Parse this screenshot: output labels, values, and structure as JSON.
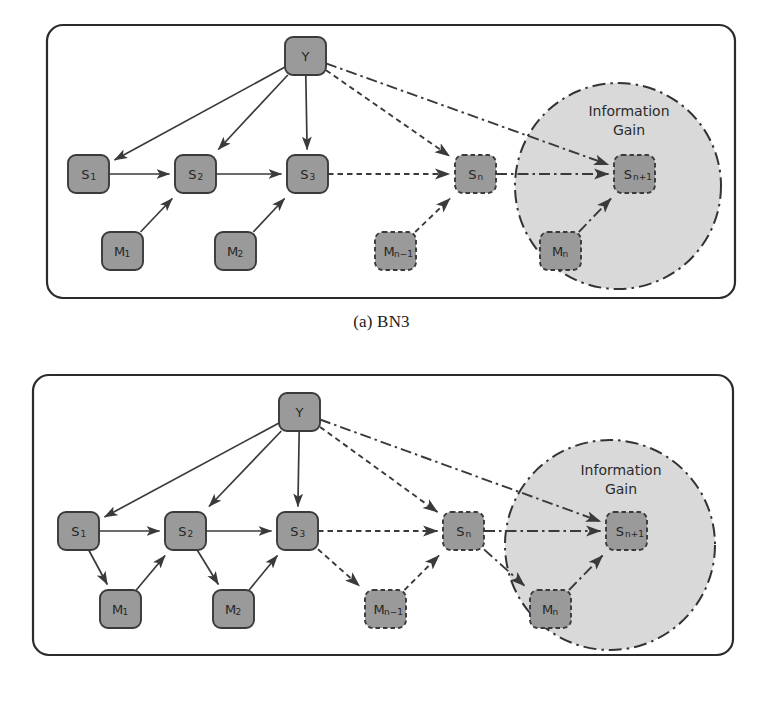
{
  "figure": {
    "style": {
      "node_fill": "#9a9a9a",
      "node_stroke": "#3a3a3a",
      "panel_stroke": "#2b2b2b",
      "circle_fill": "#d9d9d9",
      "circle_stroke": "#333333",
      "edge_color": "#3a3a3a",
      "background": "#ffffff"
    },
    "subfigures": [
      {
        "id": "BN3",
        "caption": "(a) BN3",
        "region_label": "Information Gain",
        "region_label_lines": [
          "Information",
          "Gain"
        ],
        "nodes": [
          {
            "id": "Y",
            "label": "Y",
            "sub": "",
            "style": "solid",
            "x": 285,
            "y": 37
          },
          {
            "id": "S1",
            "label": "S",
            "sub": "1",
            "style": "solid",
            "x": 68,
            "y": 155
          },
          {
            "id": "S2",
            "label": "S",
            "sub": "2",
            "style": "solid",
            "x": 175,
            "y": 155
          },
          {
            "id": "S3",
            "label": "S",
            "sub": "3",
            "style": "solid",
            "x": 287,
            "y": 155
          },
          {
            "id": "Sn",
            "label": "S",
            "sub": "n",
            "style": "dashed",
            "x": 455,
            "y": 155
          },
          {
            "id": "Sn1",
            "label": "S",
            "sub": "n+1",
            "style": "dashed",
            "x": 614,
            "y": 155
          },
          {
            "id": "M1",
            "label": "M",
            "sub": "1",
            "style": "solid",
            "x": 102,
            "y": 232
          },
          {
            "id": "M2",
            "label": "M",
            "sub": "2",
            "style": "solid",
            "x": 215,
            "y": 232
          },
          {
            "id": "Mn1",
            "label": "M",
            "sub": "n−1",
            "style": "dashed",
            "x": 375,
            "y": 232
          },
          {
            "id": "Mn",
            "label": "M",
            "sub": "n",
            "style": "dashed",
            "x": 540,
            "y": 232
          }
        ],
        "edges": [
          {
            "from": "Y",
            "to": "S1",
            "style": "solid"
          },
          {
            "from": "Y",
            "to": "S2",
            "style": "solid"
          },
          {
            "from": "Y",
            "to": "S3",
            "style": "solid"
          },
          {
            "from": "Y",
            "to": "Sn",
            "style": "dotted"
          },
          {
            "from": "Y",
            "to": "Sn1",
            "style": "dashdot"
          },
          {
            "from": "S1",
            "to": "S2",
            "style": "solid"
          },
          {
            "from": "S2",
            "to": "S3",
            "style": "solid"
          },
          {
            "from": "S3",
            "to": "Sn",
            "style": "dotted"
          },
          {
            "from": "Sn",
            "to": "Sn1",
            "style": "dashdot"
          },
          {
            "from": "M1",
            "to": "S2",
            "style": "solid"
          },
          {
            "from": "M2",
            "to": "S3",
            "style": "solid"
          },
          {
            "from": "Mn1",
            "to": "Sn",
            "style": "dotted"
          },
          {
            "from": "Mn",
            "to": "Sn1",
            "style": "dashdot"
          }
        ]
      },
      {
        "id": "BN4",
        "caption": "(b) BN4",
        "region_label": "Information Gain",
        "region_label_lines": [
          "Information",
          "Gain"
        ],
        "nodes": [
          {
            "id": "Y",
            "label": "Y",
            "sub": "",
            "style": "solid",
            "x": 279,
            "y": 393
          },
          {
            "id": "S1",
            "label": "S",
            "sub": "1",
            "style": "solid",
            "x": 58,
            "y": 512
          },
          {
            "id": "S2",
            "label": "S",
            "sub": "2",
            "style": "solid",
            "x": 165,
            "y": 512
          },
          {
            "id": "S3",
            "label": "S",
            "sub": "3",
            "style": "solid",
            "x": 277,
            "y": 512
          },
          {
            "id": "Sn",
            "label": "S",
            "sub": "n",
            "style": "dashed",
            "x": 443,
            "y": 512
          },
          {
            "id": "Sn1",
            "label": "S",
            "sub": "n+1",
            "style": "dashed",
            "x": 606,
            "y": 512
          },
          {
            "id": "M1",
            "label": "M",
            "sub": "1",
            "style": "solid",
            "x": 100,
            "y": 590
          },
          {
            "id": "M2",
            "label": "M",
            "sub": "2",
            "style": "solid",
            "x": 213,
            "y": 590
          },
          {
            "id": "Mn1",
            "label": "M",
            "sub": "n−1",
            "style": "dashed",
            "x": 365,
            "y": 590
          },
          {
            "id": "Mn",
            "label": "M",
            "sub": "n",
            "style": "dashed",
            "x": 530,
            "y": 590
          }
        ],
        "edges": [
          {
            "from": "Y",
            "to": "S1",
            "style": "solid"
          },
          {
            "from": "Y",
            "to": "S2",
            "style": "solid"
          },
          {
            "from": "Y",
            "to": "S3",
            "style": "solid"
          },
          {
            "from": "Y",
            "to": "Sn",
            "style": "dotted"
          },
          {
            "from": "Y",
            "to": "Sn1",
            "style": "dashdot"
          },
          {
            "from": "S1",
            "to": "S2",
            "style": "solid"
          },
          {
            "from": "S2",
            "to": "S3",
            "style": "solid"
          },
          {
            "from": "S3",
            "to": "Sn",
            "style": "dotted"
          },
          {
            "from": "Sn",
            "to": "Sn1",
            "style": "dashdot"
          },
          {
            "from": "S1",
            "to": "M1",
            "style": "solid"
          },
          {
            "from": "M1",
            "to": "S2",
            "style": "solid"
          },
          {
            "from": "S2",
            "to": "M2",
            "style": "solid"
          },
          {
            "from": "M2",
            "to": "S3",
            "style": "solid"
          },
          {
            "from": "S3",
            "to": "Mn1",
            "style": "dotted"
          },
          {
            "from": "Mn1",
            "to": "Sn",
            "style": "dotted"
          },
          {
            "from": "Sn",
            "to": "Mn",
            "style": "dashdot"
          },
          {
            "from": "Mn",
            "to": "Sn1",
            "style": "dashdot"
          }
        ]
      }
    ]
  }
}
